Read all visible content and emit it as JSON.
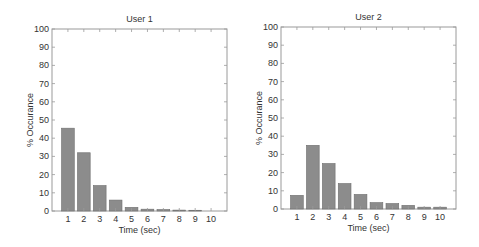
{
  "chart_data": [
    {
      "type": "bar",
      "title": "User 1",
      "xlabel": "Time (sec)",
      "ylabel": "% Occurance",
      "categories": [
        "1",
        "2",
        "3",
        "4",
        "5",
        "6",
        "7",
        "8",
        "9",
        "10"
      ],
      "values": [
        45.5,
        32,
        14,
        6,
        2,
        1,
        0.8,
        0.5,
        0.4,
        0
      ],
      "ylim": [
        0,
        100
      ],
      "yticks": [
        "0",
        "10",
        "20",
        "30",
        "40",
        "50",
        "60",
        "70",
        "80",
        "90",
        "100"
      ],
      "grid": false,
      "bar_color": "#8c8c8c"
    },
    {
      "type": "bar",
      "title": "User 2",
      "xlabel": "Time (sec)",
      "ylabel": "% Occurance",
      "categories": [
        "1",
        "2",
        "3",
        "4",
        "5",
        "6",
        "7",
        "8",
        "9",
        "10"
      ],
      "values": [
        7.5,
        35,
        25,
        14,
        8,
        3.5,
        3,
        2,
        1,
        1
      ],
      "ylim": [
        0,
        100
      ],
      "yticks": [
        "0",
        "10",
        "20",
        "30",
        "40",
        "50",
        "60",
        "70",
        "80",
        "90",
        "100"
      ],
      "grid": false,
      "bar_color": "#8c8c8c"
    }
  ]
}
